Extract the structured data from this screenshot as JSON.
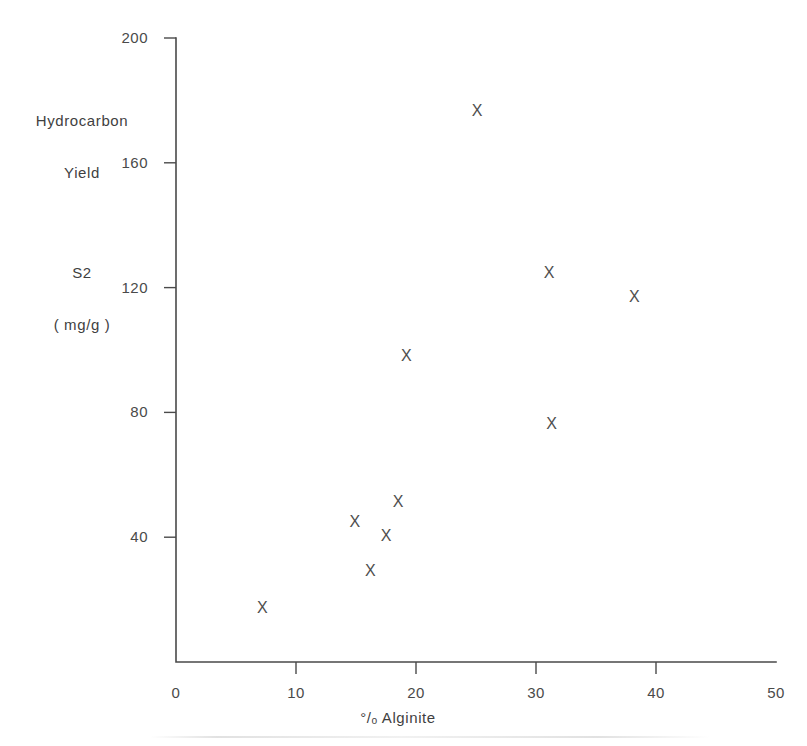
{
  "chart_data": {
    "type": "scatter",
    "title": "",
    "xlabel": "°/ₒ Alginite",
    "ylabel": "Hydrocarbon Yield S2 (mg/g)",
    "ylabel_lines": [
      "Hydrocarbon",
      "Yield",
      "S2",
      "( mg/g )"
    ],
    "xlim": [
      0,
      50
    ],
    "ylim": [
      0,
      200
    ],
    "xticks": [
      0,
      10,
      20,
      30,
      40,
      50
    ],
    "yticks": [
      0,
      40,
      80,
      120,
      160,
      200
    ],
    "xtick_labels": [
      "0",
      "10",
      "20",
      "30",
      "40",
      "50"
    ],
    "ytick_labels": [
      "0",
      "40",
      "80",
      "120",
      "160",
      "200"
    ],
    "ytick_labels_shown": [
      "40",
      "80",
      "120",
      "160",
      "200"
    ],
    "grid": false,
    "legend": "none",
    "marker": "X",
    "marker_color": "#4e4e4e",
    "axis_color": "#4a4a4a",
    "points": [
      {
        "x": 7.2,
        "y": 17.6
      },
      {
        "x": 14.9,
        "y": 44.9
      },
      {
        "x": 16.2,
        "y": 29.2
      },
      {
        "x": 17.5,
        "y": 40.7
      },
      {
        "x": 18.5,
        "y": 51.6
      },
      {
        "x": 19.2,
        "y": 98.1
      },
      {
        "x": 25.1,
        "y": 176.8
      },
      {
        "x": 31.1,
        "y": 124.7
      },
      {
        "x": 31.3,
        "y": 76.6
      },
      {
        "x": 38.2,
        "y": 117.3
      }
    ]
  },
  "figure": {
    "background": "#ffffff",
    "width": 807,
    "height": 746
  }
}
